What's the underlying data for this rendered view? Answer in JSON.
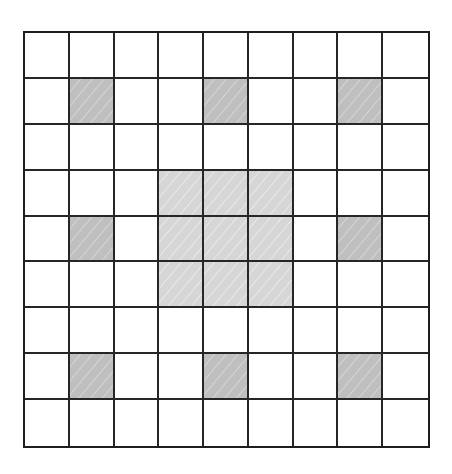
{
  "diagram": {
    "type": "grid",
    "rows": 9,
    "cols": 9,
    "colors": {
      "line": "#1e1e1e",
      "empty": "#ffffff",
      "dark_shade": "#bfbfbf",
      "light_shade": "#d6d6d6"
    },
    "dark_cells": [
      [
        1,
        1
      ],
      [
        1,
        4
      ],
      [
        1,
        7
      ],
      [
        4,
        1
      ],
      [
        4,
        7
      ],
      [
        7,
        1
      ],
      [
        7,
        4
      ],
      [
        7,
        7
      ]
    ],
    "light_block": {
      "row_start": 3,
      "row_end": 5,
      "col_start": 3,
      "col_end": 5
    }
  }
}
